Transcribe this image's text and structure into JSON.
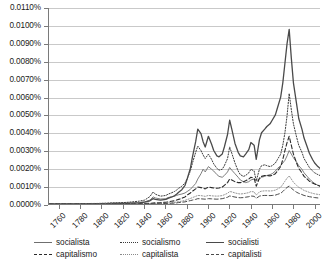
{
  "chart_data": {
    "type": "line",
    "title": "",
    "xlabel": "",
    "ylabel": "",
    "grid": true,
    "legend_position": "bottom",
    "xlim": [
      1750,
      2005
    ],
    "ylim": [
      0.0,
      0.011
    ],
    "y_tick_labels": [
      "0.0110%",
      "0.0100%",
      "0.0090%",
      "0.0080%",
      "0.0070%",
      "0.0060%",
      "0.0050%",
      "0.0040%",
      "0.0030%",
      "0.0020%",
      "0.0010%",
      "0.0000%"
    ],
    "y_tick_values": [
      0.011,
      0.01,
      0.009,
      0.008,
      0.007,
      0.006,
      0.005,
      0.004,
      0.003,
      0.002,
      0.001,
      0.0
    ],
    "x_tick_labels": [
      "1760",
      "1780",
      "1800",
      "1820",
      "1840",
      "1860",
      "1880",
      "1900",
      "1920",
      "1940",
      "1960",
      "1980",
      "2000"
    ],
    "x_tick_values": [
      1760,
      1780,
      1800,
      1820,
      1840,
      1860,
      1880,
      1900,
      1920,
      1940,
      1960,
      1980,
      2000
    ],
    "x": [
      1750,
      1755,
      1760,
      1765,
      1770,
      1775,
      1780,
      1785,
      1790,
      1795,
      1800,
      1805,
      1810,
      1815,
      1820,
      1825,
      1830,
      1835,
      1840,
      1845,
      1848,
      1850,
      1855,
      1860,
      1862,
      1865,
      1868,
      1870,
      1872,
      1875,
      1878,
      1880,
      1883,
      1885,
      1888,
      1890,
      1893,
      1895,
      1897,
      1900,
      1903,
      1905,
      1908,
      1910,
      1913,
      1915,
      1918,
      1920,
      1922,
      1925,
      1928,
      1930,
      1933,
      1935,
      1938,
      1940,
      1943,
      1945,
      1948,
      1950,
      1953,
      1955,
      1958,
      1960,
      1963,
      1965,
      1968,
      1970,
      1972,
      1974,
      1976,
      1978,
      1980,
      1983,
      1985,
      1988,
      1990,
      1993,
      1995,
      1998,
      2000,
      2003,
      2005
    ],
    "series": [
      {
        "name": "socialista",
        "style": "solid",
        "width": 0.9,
        "color": "#6f6f6f",
        "values": [
          0.0,
          0.0,
          0.0,
          0.0,
          1e-05,
          1e-05,
          1e-05,
          2e-05,
          2e-05,
          2e-05,
          3e-05,
          3e-05,
          4e-05,
          4e-05,
          5e-05,
          6e-05,
          7e-05,
          8e-05,
          0.00012,
          0.00022,
          0.0004,
          0.00034,
          0.00028,
          0.0003,
          0.00036,
          0.0004,
          0.00044,
          0.00048,
          0.00052,
          0.00056,
          0.00062,
          0.0007,
          0.00082,
          0.00095,
          0.00115,
          0.0014,
          0.0017,
          0.00195,
          0.0018,
          0.0021,
          0.00195,
          0.00185,
          0.00165,
          0.00155,
          0.0015,
          0.0016,
          0.0018,
          0.00205,
          0.0019,
          0.0017,
          0.0015,
          0.00135,
          0.00125,
          0.0012,
          0.00125,
          0.00135,
          0.0014,
          0.0013,
          0.0014,
          0.0015,
          0.00155,
          0.0016,
          0.00165,
          0.0017,
          0.00185,
          0.002,
          0.00215,
          0.0023,
          0.00245,
          0.0027,
          0.003,
          0.0028,
          0.0026,
          0.00235,
          0.00215,
          0.00195,
          0.00175,
          0.00155,
          0.0014,
          0.00125,
          0.00115,
          0.00105,
          0.001
        ]
      },
      {
        "name": "socialismo",
        "style": "dotted",
        "width": 1.0,
        "color": "#3a3a3a",
        "values": [
          0.0,
          0.0,
          0.0,
          1e-05,
          1e-05,
          1e-05,
          2e-05,
          2e-05,
          3e-05,
          3e-05,
          4e-05,
          5e-05,
          6e-05,
          7e-05,
          8e-05,
          0.0001,
          0.00013,
          0.00016,
          0.00022,
          0.00042,
          0.00068,
          0.00055,
          0.00044,
          0.00048,
          0.00055,
          0.00062,
          0.0007,
          0.00078,
          0.00088,
          0.001,
          0.00118,
          0.00142,
          0.00185,
          0.0023,
          0.0029,
          0.00325,
          0.003,
          0.00275,
          0.00255,
          0.0028,
          0.0025,
          0.00225,
          0.002,
          0.0019,
          0.00195,
          0.00215,
          0.00255,
          0.0032,
          0.00285,
          0.0023,
          0.00185,
          0.00165,
          0.00155,
          0.0016,
          0.00175,
          0.00195,
          0.00185,
          0.0013,
          0.00195,
          0.00215,
          0.0022,
          0.00215,
          0.0021,
          0.00215,
          0.0023,
          0.0025,
          0.0028,
          0.0033,
          0.004,
          0.00495,
          0.0062,
          0.0053,
          0.0045,
          0.00375,
          0.0033,
          0.0029,
          0.00255,
          0.00225,
          0.00205,
          0.00185,
          0.00175,
          0.00165,
          0.0016
        ]
      },
      {
        "name": "socialisti",
        "style": "solid",
        "width": 1.3,
        "color": "#4a4a4a",
        "values": [
          0.0,
          0.0,
          0.0,
          0.0,
          0.0,
          1e-05,
          1e-05,
          1e-05,
          1e-05,
          2e-05,
          2e-05,
          2e-05,
          3e-05,
          3e-05,
          4e-05,
          4e-05,
          5e-05,
          6e-05,
          0.0001,
          0.00018,
          0.0003,
          0.00026,
          0.00022,
          0.00026,
          0.00032,
          0.00038,
          0.00046,
          0.00055,
          0.00066,
          0.0008,
          0.00105,
          0.0014,
          0.002,
          0.00265,
          0.0035,
          0.0042,
          0.00395,
          0.0035,
          0.0032,
          0.0038,
          0.00335,
          0.003,
          0.0027,
          0.00265,
          0.0028,
          0.0032,
          0.0039,
          0.0047,
          0.0042,
          0.0034,
          0.0029,
          0.0027,
          0.00265,
          0.0028,
          0.00305,
          0.00345,
          0.0033,
          0.0025,
          0.0036,
          0.004,
          0.0042,
          0.00435,
          0.0045,
          0.0047,
          0.005,
          0.0054,
          0.006,
          0.0068,
          0.0079,
          0.009,
          0.0098,
          0.0082,
          0.0068,
          0.0056,
          0.0048,
          0.0042,
          0.0037,
          0.0032,
          0.00285,
          0.0025,
          0.0023,
          0.0021,
          0.002
        ]
      },
      {
        "name": "capitalismo",
        "style": "dashed",
        "width": 1.1,
        "color": "#2a2a2a",
        "values": [
          0.0,
          0.0,
          0.0,
          0.0,
          0.0,
          0.0,
          0.0,
          0.0,
          0.0,
          0.0,
          0.0,
          0.0,
          0.0,
          1e-05,
          1e-05,
          1e-05,
          1e-05,
          2e-05,
          3e-05,
          4e-05,
          6e-05,
          7e-05,
          8e-05,
          0.0001,
          0.00012,
          0.00015,
          0.00018,
          0.00022,
          0.00026,
          0.00032,
          0.0004,
          0.0005,
          0.00062,
          0.00072,
          0.00085,
          0.00095,
          0.00092,
          0.00088,
          0.00085,
          0.00095,
          0.00092,
          0.0009,
          0.00088,
          0.0009,
          0.00095,
          0.00105,
          0.0012,
          0.0014,
          0.00135,
          0.00125,
          0.0012,
          0.0012,
          0.00125,
          0.0013,
          0.0014,
          0.0015,
          0.00145,
          0.001,
          0.00145,
          0.00155,
          0.0016,
          0.0016,
          0.00158,
          0.0016,
          0.0017,
          0.00185,
          0.0021,
          0.0025,
          0.003,
          0.00345,
          0.0038,
          0.0033,
          0.0028,
          0.0023,
          0.002,
          0.00175,
          0.00155,
          0.0014,
          0.00128,
          0.00118,
          0.00112,
          0.00105,
          0.001
        ]
      },
      {
        "name": "capitalista",
        "style": "dotted",
        "width": 0.9,
        "color": "#8a8a8a",
        "values": [
          0.0,
          0.0,
          0.0,
          0.0,
          0.0,
          0.0,
          0.0,
          0.0,
          0.0,
          0.0,
          0.0,
          0.0,
          0.0,
          0.0,
          0.0,
          0.0,
          1e-05,
          1e-05,
          1e-05,
          2e-05,
          3e-05,
          3e-05,
          4e-05,
          5e-05,
          6e-05,
          7e-05,
          9e-05,
          0.00011,
          0.00013,
          0.00016,
          0.0002,
          0.00025,
          0.00031,
          0.00036,
          0.00043,
          0.00048,
          0.00047,
          0.00045,
          0.00043,
          0.00048,
          0.00046,
          0.00045,
          0.00044,
          0.00045,
          0.00047,
          0.00052,
          0.0006,
          0.0007,
          0.00068,
          0.00062,
          0.00058,
          0.00056,
          0.00058,
          0.0006,
          0.00064,
          0.0007,
          0.00068,
          0.0005,
          0.00068,
          0.00072,
          0.00074,
          0.00074,
          0.00073,
          0.00074,
          0.00078,
          0.00084,
          0.00094,
          0.0011,
          0.00128,
          0.00145,
          0.00158,
          0.0014,
          0.00122,
          0.00104,
          0.00094,
          0.00084,
          0.00076,
          0.0007,
          0.00065,
          0.0006,
          0.00057,
          0.00054,
          0.00052
        ]
      },
      {
        "name": "capitalisti",
        "style": "dashed",
        "width": 1.0,
        "color": "#4a4a4a",
        "values": [
          0.0,
          0.0,
          0.0,
          0.0,
          0.0,
          0.0,
          0.0,
          0.0,
          0.0,
          0.0,
          0.0,
          0.0,
          0.0,
          0.0,
          0.0,
          0.0,
          0.0,
          1e-05,
          1e-05,
          1e-05,
          2e-05,
          2e-05,
          2e-05,
          3e-05,
          4e-05,
          4e-05,
          5e-05,
          6e-05,
          8e-05,
          0.0001,
          0.00012,
          0.00015,
          0.00019,
          0.00022,
          0.00026,
          0.0003,
          0.00029,
          0.00028,
          0.00027,
          0.0003,
          0.00029,
          0.00028,
          0.00027,
          0.00028,
          0.0003,
          0.00033,
          0.00038,
          0.00045,
          0.00043,
          0.00039,
          0.00036,
          0.00035,
          0.00036,
          0.00038,
          0.00041,
          0.00045,
          0.00043,
          0.00032,
          0.00044,
          0.00047,
          0.00048,
          0.00048,
          0.00047,
          0.00048,
          0.0005,
          0.00054,
          0.0006,
          0.0007,
          0.00082,
          0.00093,
          0.00101,
          0.0009,
          0.00078,
          0.00066,
          0.0006,
          0.00053,
          0.00048,
          0.00044,
          0.00041,
          0.00038,
          0.00036,
          0.00034,
          0.00033
        ]
      }
    ],
    "legend": [
      {
        "label": "socialista",
        "style": "solid"
      },
      {
        "label": "socialismo",
        "style": "dotted"
      },
      {
        "label": "socialisti",
        "style": "solid"
      },
      {
        "label": "capitalismo",
        "style": "dashed"
      },
      {
        "label": "capitalista",
        "style": "dotted"
      },
      {
        "label": "capitalisti",
        "style": "dashed"
      }
    ]
  }
}
